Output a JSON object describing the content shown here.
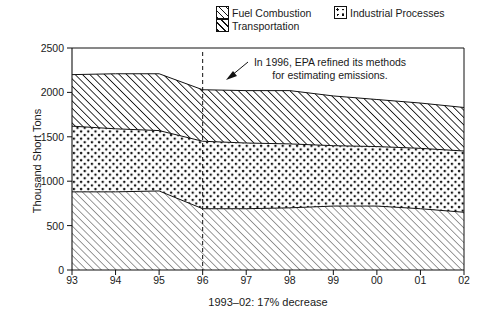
{
  "legend": {
    "items": [
      {
        "label": "Fuel Combustion",
        "swatch": "diagonal-hatch-light-icon"
      },
      {
        "label": "Industrial Processes",
        "swatch": "dot-pattern-icon"
      },
      {
        "label": "Transportation",
        "swatch": "diagonal-hatch-bold-icon"
      }
    ]
  },
  "annotation": {
    "line1": "In 1996, EPA refined its methods",
    "line2": "for estimating emissions.",
    "arrow": "arrow-down-left-icon",
    "marker_year": "96"
  },
  "axes": {
    "ylabel": "Thousand Short Tons",
    "yticks": [
      "0",
      "500",
      "1000",
      "1500",
      "2000",
      "2500"
    ],
    "xticks": [
      "93",
      "94",
      "95",
      "96",
      "97",
      "98",
      "99",
      "00",
      "01",
      "02"
    ],
    "caption": "1993–02: 17% decrease"
  },
  "chart_data": {
    "type": "area",
    "title": "",
    "xlabel": "",
    "ylabel": "Thousand Short Tons",
    "categories": [
      "93",
      "94",
      "95",
      "96",
      "97",
      "98",
      "99",
      "00",
      "01",
      "02"
    ],
    "x_values": [
      1993,
      1994,
      1995,
      1996,
      1997,
      1998,
      1999,
      2000,
      2001,
      2002
    ],
    "ylim": [
      0,
      2500
    ],
    "yticks": [
      0,
      500,
      1000,
      1500,
      2000,
      2500
    ],
    "grid": false,
    "stacked": true,
    "legend_position": "top-right",
    "units": "Thousand Short Tons",
    "series": [
      {
        "name": "Fuel Combustion",
        "pattern": "diagonal-hatch-light",
        "values": [
          880,
          880,
          890,
          690,
          690,
          700,
          720,
          720,
          690,
          650
        ]
      },
      {
        "name": "Industrial Processes",
        "pattern": "dot-pattern",
        "values": [
          740,
          710,
          680,
          760,
          740,
          720,
          680,
          670,
          680,
          690
        ]
      },
      {
        "name": "Transportation",
        "pattern": "diagonal-hatch-bold",
        "values": [
          580,
          620,
          640,
          580,
          590,
          600,
          560,
          530,
          510,
          490
        ]
      }
    ],
    "cumulative_totals": [
      2200,
      2210,
      2210,
      2030,
      2020,
      2020,
      1960,
      1920,
      1880,
      1830
    ],
    "cumulative_boundaries": {
      "fuel_top": [
        880,
        880,
        890,
        690,
        690,
        700,
        720,
        720,
        690,
        650
      ],
      "industrial_top": [
        1620,
        1590,
        1570,
        1450,
        1430,
        1420,
        1400,
        1390,
        1370,
        1340
      ],
      "transportation_top": [
        2200,
        2210,
        2210,
        2030,
        2020,
        2020,
        1960,
        1920,
        1880,
        1830
      ]
    },
    "annotations": [
      {
        "text": "In 1996, EPA refined its methods for estimating emissions.",
        "x": 1996,
        "type": "vertical-dashed-line-with-arrow"
      }
    ],
    "footnote": "1993–02: 17% decrease"
  },
  "colors": {
    "ink": "#111111",
    "background": "#ffffff"
  }
}
